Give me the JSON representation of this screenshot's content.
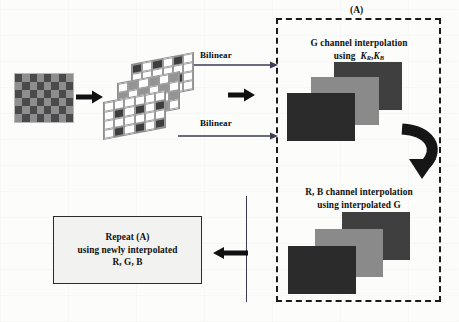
{
  "figure": {
    "title_label": "(A)",
    "region_a": {
      "step1_line1": "G channel interpolation",
      "step1_line2_prefix": "using",
      "step1_kernel_1": "K",
      "step1_kernel_1_sub": "R",
      "step1_kernel_2": "K",
      "step1_kernel_2_sub": "B",
      "step2_line1": "R, B channel interpolation",
      "step2_line2": "using interpolated G"
    },
    "arrows": {
      "bilinear_top": "Bilinear",
      "bilinear_bottom": "Bilinear",
      "mosaic_to_planes": "right-arrow-icon",
      "planes_to_region": "right-arrow-icon",
      "g_to_rb": "curved-down-arrow-icon",
      "feedback": "left-arrow-icon"
    },
    "repeat_box": {
      "line1": "Repeat (A)",
      "line2": "using newly interpolated",
      "line3": "R, G, B"
    },
    "colors": {
      "ink": "#101010",
      "dash_border": "#1a1a1a",
      "arrow_thin": "#3b3b55",
      "tile_dark": "#2b2b2b",
      "tile_mid": "#8a8a8a",
      "tile_back": "#3f3f3f",
      "mosaic_dark": "#4a4a4a",
      "mosaic_mid": "#8e8e8e",
      "plane_cell_dark": "#3e3e3e",
      "plane_cell_gray": "#949494",
      "plane_cell_white": "#ffffff",
      "paper": "#fdfdfb"
    },
    "mosaic": {
      "cols": 8,
      "rows": 6,
      "pattern": [
        [
          0,
          1,
          0,
          1,
          0,
          1,
          0,
          1
        ],
        [
          1,
          0,
          1,
          0,
          1,
          0,
          1,
          0
        ],
        [
          0,
          1,
          0,
          1,
          0,
          1,
          0,
          1
        ],
        [
          1,
          0,
          1,
          0,
          1,
          0,
          1,
          0
        ],
        [
          0,
          1,
          0,
          1,
          0,
          1,
          0,
          1
        ],
        [
          1,
          0,
          1,
          0,
          1,
          0,
          1,
          0
        ]
      ]
    },
    "plane_back": {
      "cols": 6,
      "rows": 4,
      "pattern": [
        [
          1,
          0,
          1,
          0,
          1,
          0
        ],
        [
          0,
          0,
          0,
          0,
          0,
          0
        ],
        [
          1,
          0,
          1,
          0,
          1,
          0
        ],
        [
          0,
          0,
          0,
          0,
          0,
          0
        ]
      ]
    },
    "plane_mid": {
      "cols": 6,
      "rows": 4,
      "pattern": [
        [
          0,
          2,
          0,
          2,
          0,
          2
        ],
        [
          2,
          0,
          2,
          0,
          2,
          0
        ],
        [
          0,
          2,
          0,
          2,
          0,
          2
        ],
        [
          2,
          0,
          2,
          0,
          2,
          0
        ]
      ]
    },
    "plane_front": {
      "cols": 6,
      "rows": 4,
      "pattern": [
        [
          0,
          0,
          0,
          0,
          0,
          0
        ],
        [
          0,
          1,
          0,
          1,
          0,
          1
        ],
        [
          0,
          0,
          0,
          0,
          0,
          0
        ],
        [
          0,
          1,
          0,
          1,
          0,
          1
        ]
      ]
    },
    "stack_top": {
      "tiles": [
        "image-plane-back",
        "image-plane-middle",
        "image-plane-front"
      ]
    },
    "stack_bottom": {
      "tiles": [
        "image-plane-back",
        "image-plane-middle",
        "image-plane-front"
      ]
    }
  }
}
